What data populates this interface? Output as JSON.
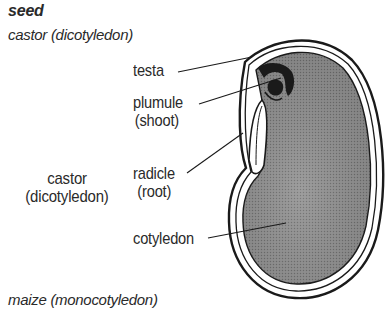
{
  "title": "seed",
  "subtitle_top": "castor (dicotyledon)",
  "subtitle_bottom": "maize (monocotyledon)",
  "side_label": {
    "line1": "castor",
    "line2": "(dicotyledon)"
  },
  "parts": [
    {
      "name": "testa",
      "line1": "testa"
    },
    {
      "name": "plumule",
      "line1": "plumule",
      "line2": "(shoot)"
    },
    {
      "name": "radicle",
      "line1": "radicle",
      "line2": "(root)"
    },
    {
      "name": "cotyledon",
      "line1": "cotyledon"
    }
  ],
  "colors": {
    "outline": "#1a1a1a",
    "fill": "#8a8a8a",
    "text": "#2a2a2a"
  }
}
